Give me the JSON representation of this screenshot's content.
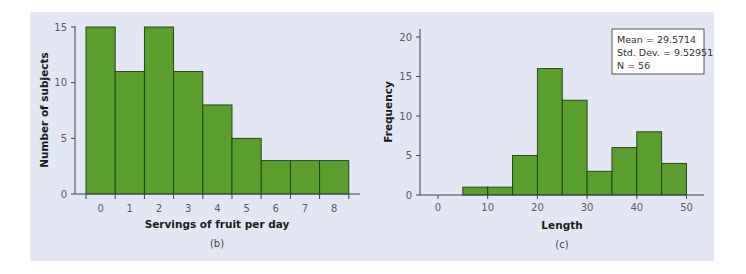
{
  "chart_data": [
    {
      "type": "bar",
      "panel": "(b)",
      "title": "",
      "xlabel": "Servings of fruit per day",
      "ylabel": "Number of subjects",
      "categories": [
        "0",
        "1",
        "2",
        "3",
        "4",
        "5",
        "6",
        "7",
        "8"
      ],
      "values": [
        15,
        11,
        15,
        11,
        8,
        5,
        3,
        3,
        3
      ],
      "ylim": [
        0,
        15
      ],
      "yticks": [
        0,
        5,
        10,
        15
      ],
      "grid": false,
      "bar_color": "#5a9e2e"
    },
    {
      "type": "bar",
      "panel": "(c)",
      "title": "",
      "xlabel": "Length",
      "ylabel": "Frequency",
      "bins": [
        [
          5,
          10
        ],
        [
          10,
          15
        ],
        [
          15,
          20
        ],
        [
          20,
          25
        ],
        [
          25,
          30
        ],
        [
          30,
          35
        ],
        [
          35,
          40
        ],
        [
          40,
          45
        ],
        [
          45,
          50
        ]
      ],
      "values": [
        1,
        1,
        5,
        16,
        12,
        3,
        6,
        8,
        4
      ],
      "xticks": [
        0,
        10,
        20,
        30,
        40,
        50
      ],
      "ylim": [
        0,
        20
      ],
      "yticks": [
        0,
        5,
        10,
        15,
        20
      ],
      "grid": false,
      "bar_color": "#5a9e2e",
      "annotation": {
        "mean": "Mean = 29.5714",
        "std": "Std. Dev. = 9.52951",
        "n": "N = 56"
      }
    }
  ]
}
